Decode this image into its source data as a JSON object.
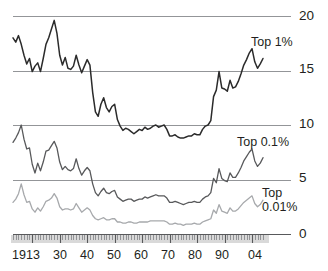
{
  "chart_data": {
    "type": "line",
    "title": "",
    "xlabel": "",
    "ylabel": "",
    "xlim": [
      1913,
      2004
    ],
    "ylim": [
      0,
      20
    ],
    "grid": true,
    "legend_position": "inline-right",
    "ytick_labels": [
      "20",
      "15",
      "10",
      "5",
      "0"
    ],
    "ytick_values": [
      20,
      15,
      10,
      5,
      0
    ],
    "xtick_labels": [
      "1913",
      "30",
      "40",
      "50",
      "60",
      "70",
      "80",
      "90",
      "04"
    ],
    "xtick_values": [
      1913,
      1930,
      1940,
      1950,
      1960,
      1970,
      1980,
      1990,
      2004
    ],
    "colors": {
      "top1": "#2b2b2b",
      "top01": "#58595b",
      "top001": "#a7a9ac",
      "gridline": "#939598",
      "axis": "#58595b"
    },
    "series": [
      {
        "name": "Top 1%",
        "label": "Top 1%",
        "color": "#2b2b2b",
        "x": [
          1913,
          1914,
          1915,
          1916,
          1917,
          1918,
          1919,
          1920,
          1921,
          1922,
          1923,
          1924,
          1925,
          1926,
          1927,
          1928,
          1929,
          1930,
          1931,
          1932,
          1933,
          1934,
          1935,
          1936,
          1937,
          1938,
          1939,
          1940,
          1941,
          1942,
          1943,
          1944,
          1945,
          1946,
          1947,
          1948,
          1949,
          1950,
          1951,
          1952,
          1953,
          1954,
          1955,
          1956,
          1957,
          1958,
          1959,
          1960,
          1961,
          1962,
          1963,
          1964,
          1965,
          1966,
          1967,
          1968,
          1969,
          1970,
          1971,
          1972,
          1973,
          1974,
          1975,
          1976,
          1977,
          1978,
          1979,
          1980,
          1981,
          1982,
          1983,
          1984,
          1985,
          1986,
          1987,
          1988,
          1989,
          1990,
          1991,
          1992,
          1993,
          1994,
          1995,
          1996,
          1997,
          1998,
          1999,
          2000,
          2001,
          2002,
          2003,
          2004
        ],
        "values": [
          18.0,
          17.6,
          18.2,
          17.4,
          16.4,
          15.6,
          16.1,
          14.9,
          15.4,
          15.7,
          14.9,
          16.1,
          17.4,
          18.0,
          18.8,
          19.6,
          18.4,
          16.4,
          15.5,
          16.2,
          15.2,
          15.1,
          15.4,
          16.4,
          15.5,
          14.8,
          15.4,
          16.0,
          15.5,
          13.0,
          11.2,
          10.8,
          11.9,
          12.5,
          11.6,
          11.2,
          11.7,
          11.9,
          10.5,
          9.9,
          9.5,
          9.7,
          9.6,
          9.4,
          9.2,
          9.4,
          9.6,
          9.5,
          9.8,
          9.6,
          9.7,
          9.9,
          10.0,
          9.8,
          9.9,
          10.0,
          9.6,
          9.0,
          9.0,
          9.1,
          8.9,
          8.8,
          8.8,
          8.9,
          9.0,
          9.0,
          9.2,
          9.1,
          9.1,
          9.6,
          9.9,
          10.0,
          10.4,
          12.6,
          13.2,
          14.9,
          13.4,
          13.3,
          13.1,
          14.1,
          13.4,
          13.5,
          14.0,
          14.7,
          15.5,
          16.0,
          16.6,
          17.0,
          15.8,
          15.2,
          15.6,
          16.1
        ]
      },
      {
        "name": "Top 0.1%",
        "label": "Top 0.1%",
        "color": "#58595b",
        "x": [
          1913,
          1914,
          1915,
          1916,
          1917,
          1918,
          1919,
          1920,
          1921,
          1922,
          1923,
          1924,
          1925,
          1926,
          1927,
          1928,
          1929,
          1930,
          1931,
          1932,
          1933,
          1934,
          1935,
          1936,
          1937,
          1938,
          1939,
          1940,
          1941,
          1942,
          1943,
          1944,
          1945,
          1946,
          1947,
          1948,
          1949,
          1950,
          1951,
          1952,
          1953,
          1954,
          1955,
          1956,
          1957,
          1958,
          1959,
          1960,
          1961,
          1962,
          1963,
          1964,
          1965,
          1966,
          1967,
          1968,
          1969,
          1970,
          1971,
          1972,
          1973,
          1974,
          1975,
          1976,
          1977,
          1978,
          1979,
          1980,
          1981,
          1982,
          1983,
          1984,
          1985,
          1986,
          1987,
          1988,
          1989,
          1990,
          1991,
          1992,
          1993,
          1994,
          1995,
          1996,
          1997,
          1998,
          1999,
          2000,
          2001,
          2002,
          2003,
          2004
        ],
        "values": [
          8.4,
          8.8,
          9.3,
          10.0,
          8.7,
          7.8,
          7.9,
          6.4,
          5.6,
          6.5,
          5.8,
          6.6,
          7.6,
          7.7,
          8.1,
          8.5,
          7.9,
          6.6,
          5.9,
          6.2,
          5.9,
          5.8,
          6.0,
          6.9,
          6.0,
          5.4,
          5.8,
          6.1,
          5.8,
          4.6,
          3.8,
          3.5,
          3.9,
          4.2,
          3.8,
          3.7,
          3.9,
          4.0,
          3.4,
          3.2,
          3.0,
          3.1,
          3.2,
          3.2,
          3.0,
          3.1,
          3.2,
          3.2,
          3.4,
          3.3,
          3.4,
          3.5,
          3.6,
          3.5,
          3.5,
          3.5,
          3.3,
          2.9,
          2.9,
          3.0,
          2.9,
          2.8,
          2.7,
          2.8,
          2.9,
          2.9,
          3.0,
          2.9,
          2.9,
          3.2,
          3.4,
          3.5,
          3.8,
          5.1,
          4.7,
          6.0,
          5.1,
          4.9,
          4.8,
          5.6,
          5.2,
          5.2,
          5.6,
          6.1,
          6.7,
          7.1,
          7.5,
          7.8,
          6.7,
          6.2,
          6.5,
          7.0
        ]
      },
      {
        "name": "Top 0.01%",
        "label_line1": "Top",
        "label_line2": "0.01%",
        "label": "Top 0.01%",
        "color": "#a7a9ac",
        "x": [
          1913,
          1914,
          1915,
          1916,
          1917,
          1918,
          1919,
          1920,
          1921,
          1922,
          1923,
          1924,
          1925,
          1926,
          1927,
          1928,
          1929,
          1930,
          1931,
          1932,
          1933,
          1934,
          1935,
          1936,
          1937,
          1938,
          1939,
          1940,
          1941,
          1942,
          1943,
          1944,
          1945,
          1946,
          1947,
          1948,
          1949,
          1950,
          1951,
          1952,
          1953,
          1954,
          1955,
          1956,
          1957,
          1958,
          1959,
          1960,
          1961,
          1962,
          1963,
          1964,
          1965,
          1966,
          1967,
          1968,
          1969,
          1970,
          1971,
          1972,
          1973,
          1974,
          1975,
          1976,
          1977,
          1978,
          1979,
          1980,
          1981,
          1982,
          1983,
          1984,
          1985,
          1986,
          1987,
          1988,
          1989,
          1990,
          1991,
          1992,
          1993,
          1994,
          1995,
          1996,
          1997,
          1998,
          1999,
          2000,
          2001,
          2002,
          2003,
          2004
        ],
        "values": [
          2.9,
          3.2,
          3.7,
          4.6,
          3.6,
          2.9,
          3.0,
          2.3,
          2.0,
          2.4,
          2.1,
          2.5,
          3.0,
          3.1,
          3.3,
          3.7,
          3.3,
          2.5,
          2.2,
          2.3,
          2.3,
          2.2,
          2.3,
          2.8,
          2.4,
          2.0,
          2.2,
          2.4,
          2.2,
          1.7,
          1.4,
          1.3,
          1.4,
          1.5,
          1.3,
          1.3,
          1.4,
          1.4,
          1.1,
          1.1,
          1.0,
          1.0,
          1.1,
          1.1,
          1.0,
          1.0,
          1.1,
          1.1,
          1.1,
          1.1,
          1.2,
          1.2,
          1.2,
          1.2,
          1.2,
          1.2,
          1.1,
          0.9,
          0.9,
          1.0,
          0.9,
          0.9,
          0.8,
          0.9,
          0.9,
          0.9,
          1.0,
          0.9,
          0.9,
          1.1,
          1.2,
          1.3,
          1.4,
          2.2,
          1.9,
          2.7,
          2.1,
          2.0,
          1.9,
          2.4,
          2.1,
          2.1,
          2.3,
          2.6,
          2.9,
          3.1,
          3.3,
          3.5,
          2.8,
          2.5,
          2.7,
          3.1
        ]
      }
    ]
  }
}
